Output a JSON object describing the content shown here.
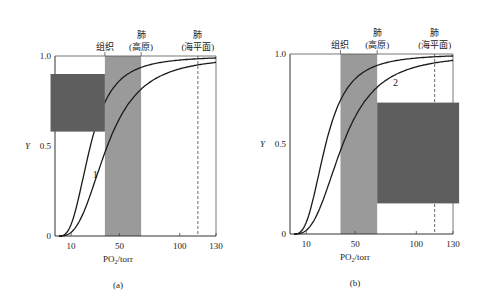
{
  "chart_data": [
    {
      "type": "line",
      "panel_label": "(a)",
      "xlabel": "PO2/torr",
      "ylabel": "Y",
      "xlim": [
        0,
        130
      ],
      "ylim": [
        0,
        1.0
      ],
      "x_ticks": [
        10,
        50,
        100,
        130
      ],
      "y_ticks": [
        0,
        0.5,
        1.0
      ],
      "y_tick_labels": [
        "0",
        "0.5",
        "1.0"
      ],
      "top_labels": [
        {
          "x": 38,
          "lines": [
            "组织"
          ]
        },
        {
          "x": 68,
          "lines": [
            "肺",
            "(高原)"
          ]
        },
        {
          "x": 115,
          "lines": [
            "肺",
            "(海平面)"
          ]
        }
      ],
      "shaded_band": {
        "x0": 38,
        "x1": 68,
        "color": "#9a9a9a"
      },
      "dashed_line_x": 115,
      "curve_label": {
        "text": "1",
        "x": 28,
        "y": 0.32
      },
      "series": [
        {
          "name": "left curve (high affinity)",
          "p50": 26,
          "n": 2.8
        },
        {
          "name": "right curve (lower affinity)",
          "p50": 40,
          "n": 2.8
        }
      ],
      "overlay_box": {
        "x0": -7,
        "x1": 38,
        "y0": 0.58,
        "y1": 0.9,
        "color": "#5e5e5e"
      }
    },
    {
      "type": "line",
      "panel_label": "(b)",
      "xlabel": "PO2/torr",
      "ylabel": "Y",
      "xlim": [
        0,
        130
      ],
      "ylim": [
        0,
        1.0
      ],
      "x_ticks": [
        10,
        50,
        100,
        130
      ],
      "y_ticks": [
        0,
        0.5,
        1.0
      ],
      "y_tick_labels": [
        "0",
        "0.5",
        "1.0"
      ],
      "top_labels": [
        {
          "x": 38,
          "lines": [
            "组织"
          ]
        },
        {
          "x": 68,
          "lines": [
            "肺",
            "(高原)"
          ]
        },
        {
          "x": 115,
          "lines": [
            "肺",
            "(海平面)"
          ]
        }
      ],
      "shaded_band": {
        "x0": 38,
        "x1": 68,
        "color": "#9a9a9a"
      },
      "dashed_line_x": 115,
      "curve_label": {
        "text": "2",
        "x": 81,
        "y": 0.82
      },
      "series": [
        {
          "name": "left curve (high affinity)",
          "p50": 26,
          "n": 2.8
        },
        {
          "name": "right curve (lower affinity)",
          "p50": 40,
          "n": 2.8
        }
      ],
      "overlay_box": {
        "x0": 68,
        "x1": 135,
        "y0": 0.17,
        "y1": 0.73,
        "color": "#5e5e5e"
      }
    }
  ],
  "panels": [
    {
      "label": "(a)",
      "xlabel": "PO2/torr"
    },
    {
      "label": "(b)",
      "xlabel": "PO2/torr"
    }
  ]
}
